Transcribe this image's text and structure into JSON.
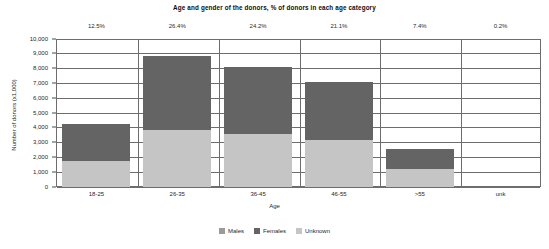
{
  "chart_data": {
    "type": "bar",
    "subtype": "stacked",
    "title": "Age and gender of the donors, % of donors in each age category",
    "xlabel": "Age",
    "ylabel": "Number of donors (x1,000)",
    "categories": [
      "18-25",
      "26-35",
      "36-45",
      "46-55",
      ">55",
      "unk"
    ],
    "series": [
      {
        "name": "Males",
        "color": "#9a9a9a",
        "values": [
          0,
          0,
          0,
          0,
          0,
          0
        ]
      },
      {
        "name": "Females",
        "color": "#646464",
        "values": [
          2500,
          5050,
          4550,
          3900,
          1350,
          0
        ]
      },
      {
        "name": "Unknown",
        "color": "#c5c5c5",
        "values": [
          1700,
          3800,
          3550,
          3150,
          1200,
          0
        ]
      }
    ],
    "stack_order": [
      "Unknown",
      "Females",
      "Males"
    ],
    "totals": [
      4200,
      8850,
      8100,
      7050,
      2550,
      0
    ],
    "percent_labels": [
      "12.5%",
      "26.4%",
      "24.2%",
      "21.1%",
      "7.4%",
      "0.2%"
    ],
    "ylim": [
      0,
      10000
    ],
    "ytick_step": 1000,
    "ytick_labels": [
      "10,000",
      "9,000",
      "8,000",
      "7,000",
      "6,000",
      "5,000",
      "4,000",
      "3,000",
      "2,000",
      "1,000",
      "0"
    ],
    "grid": true,
    "legend_position": "bottom"
  },
  "legend": {
    "items": [
      {
        "label": "Males",
        "color": "#9a9a9a"
      },
      {
        "label": "Females",
        "color": "#646464"
      },
      {
        "label": "Unknown",
        "color": "#c5c5c5"
      }
    ]
  }
}
